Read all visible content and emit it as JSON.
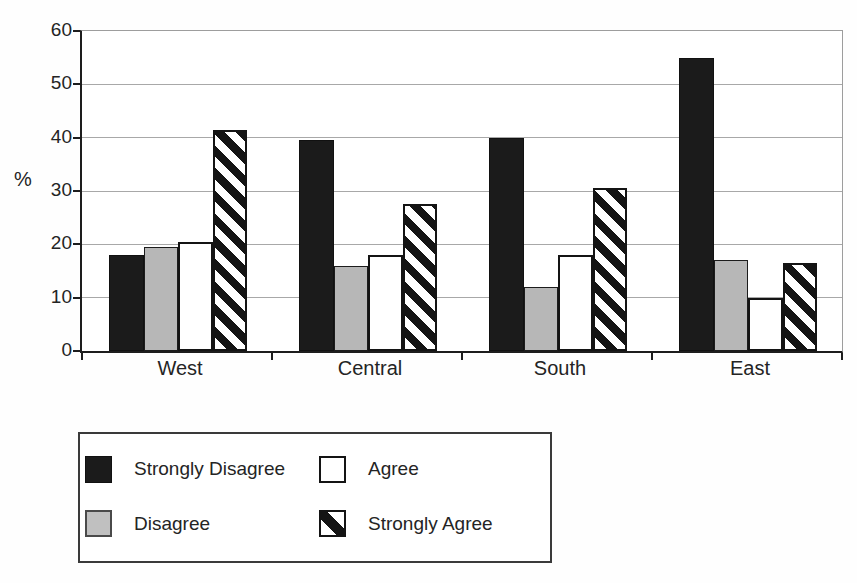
{
  "chart_data": {
    "type": "bar",
    "title": "",
    "xlabel": "",
    "ylabel": "%",
    "ylim": [
      0,
      60
    ],
    "yticks": [
      0,
      10,
      20,
      30,
      40,
      50,
      60
    ],
    "grid": true,
    "legend_position": "bottom-left-box",
    "categories": [
      "West",
      "Central",
      "South",
      "East"
    ],
    "series": [
      {
        "name": "Strongly Disagree",
        "pattern": "solid-black",
        "values": [
          18,
          39.5,
          40,
          55
        ]
      },
      {
        "name": "Disagree",
        "pattern": "solid-gray",
        "values": [
          19.5,
          16,
          12,
          17
        ]
      },
      {
        "name": "Agree",
        "pattern": "solid-white",
        "values": [
          20.5,
          18,
          18,
          10
        ]
      },
      {
        "name": "Strongly Agree",
        "pattern": "diagonal-stripes",
        "values": [
          41.5,
          27.5,
          30.5,
          16.5
        ]
      }
    ]
  },
  "colors": {
    "bar_black": "#1b1b1b",
    "bar_gray": "#b7b7b7",
    "bar_white": "#ffffff",
    "stripe_black": "#141414",
    "gridline": "#a8a8a8",
    "axis": "#1d1d1d",
    "text": "#242424",
    "background": "#ffffff"
  }
}
